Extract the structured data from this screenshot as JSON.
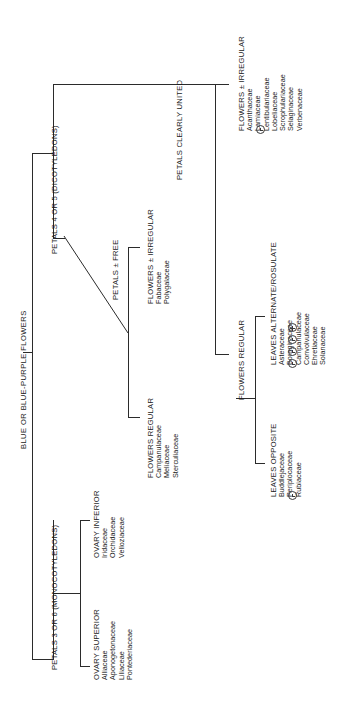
{
  "diagram": {
    "title": "BLUE OR BLUE-PURPLE FLOWERS",
    "type": "dichotomous-key",
    "orientation": "rotated-90-ccw",
    "colors": {
      "line": "#2b2b2b",
      "text": "#1a1a1a",
      "background": "#ffffff"
    },
    "nodes": {
      "root": "BLUE OR BLUE-PURPLE FLOWERS",
      "monocots": "PETALS 3 OR 6 (MONOCOTYLEDONS)",
      "dicots": "PETALS 4 OR 5 (DICOTYLEDONS)",
      "ovary_superior": "OVARY SUPERIOR",
      "ovary_inferior": "OVARY INFERIOR",
      "petals_free": "PETALS ± FREE",
      "petals_united": "PETALS CLEARLY UNITED",
      "flowers_regular_free": "FLOWERS REGULAR",
      "flowers_irregular_free": "FLOWERS ± IRREGULAR",
      "flowers_regular_united": "FLOWERS REGULAR",
      "flowers_irregular_united": "FLOWERS ± IRREGULAR",
      "leaves_opposite": "LEAVES OPPOSITE",
      "leaves_alternate": "LEAVES ALTERNATE/ROSULATE"
    },
    "families": {
      "ovary_superior": [
        "Alliaceae",
        "Aponogetonaceae",
        "Liliaceae",
        "Pontederiaceae"
      ],
      "ovary_inferior": [
        "Iridaceae",
        "Orchidaceae",
        "Velloziaceae"
      ],
      "flowers_regular_free": [
        "Campanulaceae",
        "Meliaceae",
        "Sterculiaceae"
      ],
      "flowers_irregular_free": [
        "Fabaceae",
        "Polygalaceae"
      ],
      "flowers_irregular_united": [
        "Acanthaceae",
        "Lamiaceae",
        "Lentibulariaceae",
        "Lobeliaceae",
        "Scrophulariaceae",
        "Selaginaceae",
        "Verbenaceae"
      ],
      "leaves_opposite": [
        "Buddlejaceae",
        "Periplocaceae",
        "Rubiaceae"
      ],
      "leaves_alternate": [
        "Asteraceae",
        "Boraginaceae",
        "Campanulaceae",
        "Convolvulaceae",
        "Ehretiaceae",
        "Solanaceae"
      ]
    },
    "markers": {
      "irregular_united": [
        "clock-badge-icon"
      ],
      "leaves_opposite": [
        "clock-badge-icon"
      ],
      "leaves_alternate": [
        "clock-badge-icon",
        "clock-badge-icon",
        "clock-badge-icon",
        "plus-badge-icon"
      ]
    }
  }
}
